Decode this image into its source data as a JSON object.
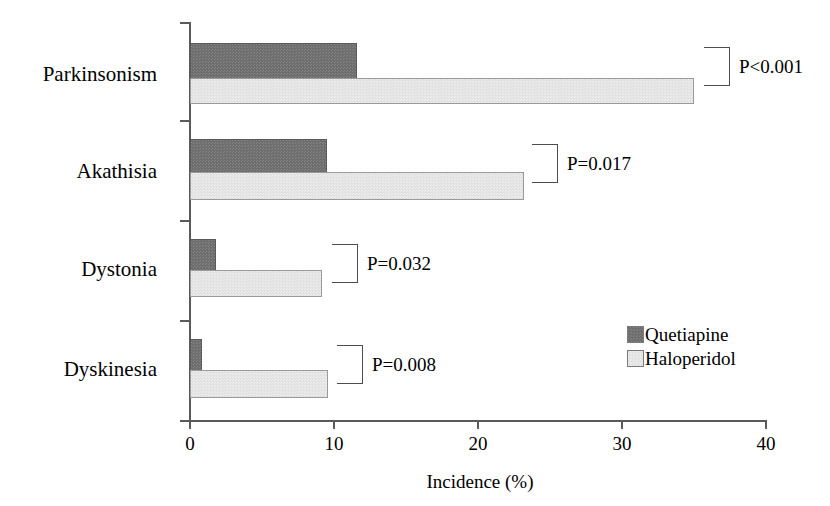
{
  "chart_data": {
    "type": "bar",
    "orientation": "horizontal",
    "title": "",
    "xlabel": "Incidence (%)",
    "ylabel": "",
    "xlim": [
      0,
      40
    ],
    "xticks": [
      0,
      10,
      20,
      30,
      40
    ],
    "xtick_labels": [
      "0",
      "10",
      "20",
      "30",
      "40"
    ],
    "grid": false,
    "legend_position": "center-right",
    "categories": [
      "Parkinsonism",
      "Akathisia",
      "Dystonia",
      "Dyskinesia"
    ],
    "series": [
      {
        "name": "Quetiapine",
        "color": "#6e6e6e",
        "values": [
          11.6,
          9.5,
          1.8,
          0.8
        ]
      },
      {
        "name": "Haloperidol",
        "color": "#e2e2e2",
        "values": [
          35.0,
          23.2,
          9.2,
          9.6
        ]
      }
    ],
    "annotations": [
      {
        "category": "Parkinsonism",
        "text": "P<0.001"
      },
      {
        "category": "Akathisia",
        "text": "P=0.017"
      },
      {
        "category": "Dystonia",
        "text": "P=0.032"
      },
      {
        "category": "Dyskinesia",
        "text": "P=0.008"
      }
    ]
  },
  "axis": {
    "x_title": "Incidence (%)",
    "ticks": [
      "0",
      "10",
      "20",
      "30",
      "40"
    ]
  },
  "legend": {
    "entries": [
      {
        "label": "Quetiapine"
      },
      {
        "label": "Haloperidol"
      }
    ]
  }
}
